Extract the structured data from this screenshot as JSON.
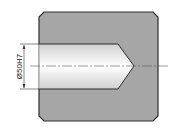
{
  "drawing": {
    "title": "Blind hole section",
    "dimension_label": "Ø50H7",
    "colors": {
      "body_fill": "#a6a6a6",
      "outline": "#333333",
      "hole_fill_light": "#ffffff",
      "hole_fill_dark": "#cfcfcf",
      "centerline": "#555555"
    }
  }
}
